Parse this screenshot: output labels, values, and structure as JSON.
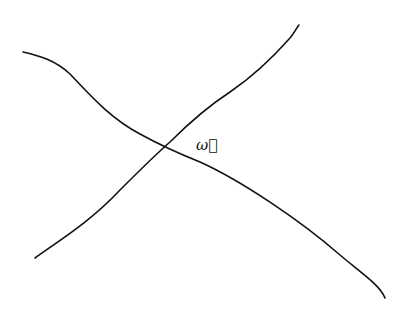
{
  "diagram": {
    "stroke_color": "#111111",
    "background": "#ffffff",
    "lines": [
      {
        "name": "line-a",
        "from": [
          23,
          52
        ],
        "to": [
          385,
          298
        ]
      },
      {
        "name": "line-b",
        "from": [
          35,
          258
        ],
        "to": [
          299,
          25
        ]
      }
    ],
    "intersection": [
      164,
      147
    ],
    "label": {
      "text": "ω⃗",
      "x": 196,
      "y": 138
    }
  }
}
